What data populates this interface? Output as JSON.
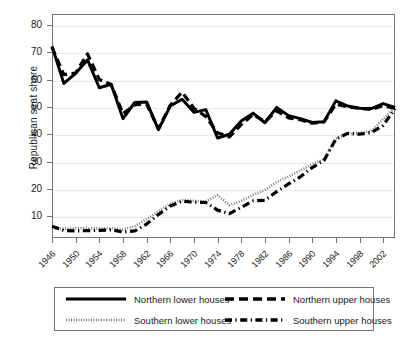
{
  "chart_data": {
    "type": "line",
    "title": "",
    "xlabel": "",
    "ylabel": "Republican seat share",
    "xlim": [
      1946,
      2004
    ],
    "ylim": [
      2,
      84
    ],
    "grid": true,
    "legend_position": "below-axes",
    "ytick_labels": [
      "10",
      "20",
      "30",
      "40",
      "50",
      "60",
      "70",
      "80"
    ],
    "ytick_values": [
      10,
      20,
      30,
      40,
      50,
      60,
      70,
      80
    ],
    "xtick_labels": [
      "1946",
      "1950",
      "1954",
      "1958",
      "1962",
      "1966",
      "1970",
      "1974",
      "1978",
      "1982",
      "1986",
      "1990",
      "1994",
      "1998",
      "2002"
    ],
    "xtick_values": [
      1946,
      1950,
      1954,
      1958,
      1962,
      1966,
      1970,
      1974,
      1978,
      1982,
      1986,
      1990,
      1994,
      1998,
      2002
    ],
    "x": [
      1946,
      1948,
      1950,
      1952,
      1954,
      1956,
      1958,
      1960,
      1962,
      1964,
      1966,
      1968,
      1970,
      1972,
      1974,
      1976,
      1978,
      1980,
      1982,
      1984,
      1986,
      1988,
      1990,
      1992,
      1994,
      1996,
      1998,
      2000,
      2002,
      2004
    ],
    "series": [
      {
        "name": "Northern lower houses",
        "style": "solid",
        "values": [
          72.2,
          58.6,
          62.3,
          67.2,
          57.0,
          58.3,
          45.7,
          51.6,
          51.8,
          41.7,
          50.3,
          52.8,
          48.0,
          49.0,
          38.6,
          40.0,
          44.8,
          47.7,
          44.2,
          49.8,
          46.8,
          45.7,
          44.3,
          44.6,
          52.2,
          50.3,
          49.5,
          49.4,
          51.2,
          49.8
        ]
      },
      {
        "name": "Northern upper houses",
        "style": "dashed",
        "values": [
          71.8,
          61.8,
          62.4,
          69.4,
          60.0,
          58.2,
          47.5,
          50.8,
          51.0,
          42.0,
          50.6,
          55.4,
          49.5,
          46.5,
          40.5,
          39.0,
          43.5,
          47.2,
          44.6,
          48.5,
          46.0,
          45.3,
          44.0,
          44.5,
          51.0,
          50.0,
          49.5,
          49.0,
          50.5,
          49.5
        ]
      },
      {
        "name": "Southern lower houses",
        "style": "dotted",
        "values": [
          5.3,
          5.4,
          5.6,
          5.6,
          5.5,
          5.5,
          5.2,
          6.3,
          8.9,
          11.8,
          14.5,
          15.9,
          15.6,
          15.4,
          17.7,
          14.0,
          15.6,
          17.8,
          19.6,
          22.5,
          24.5,
          26.7,
          29.1,
          30.8,
          38.4,
          40.1,
          40.5,
          41.1,
          45.6,
          49.8
        ]
      },
      {
        "name": "Southern upper houses",
        "style": "dash-dot",
        "values": [
          6.3,
          4.7,
          4.6,
          4.7,
          4.8,
          5.0,
          4.2,
          4.6,
          7.1,
          10.6,
          13.7,
          15.5,
          15.1,
          15.0,
          12.2,
          10.9,
          13.2,
          15.6,
          15.8,
          19.0,
          21.8,
          24.4,
          27.8,
          30.4,
          38.2,
          40.3,
          40.0,
          40.6,
          43.2,
          49.4
        ]
      }
    ]
  },
  "legend": {
    "entries": [
      {
        "label": "Northern lower houses",
        "style": "solid"
      },
      {
        "label": "Northern upper houses",
        "style": "dashed"
      },
      {
        "label": "Southern lower houses",
        "style": "dotted"
      },
      {
        "label": "Southern upper houses",
        "style": "dash-dot"
      }
    ]
  },
  "colors": {
    "line": "#000000",
    "axis": "#6f7480",
    "grid": "#e9e9ea",
    "background": "#ffffff"
  }
}
